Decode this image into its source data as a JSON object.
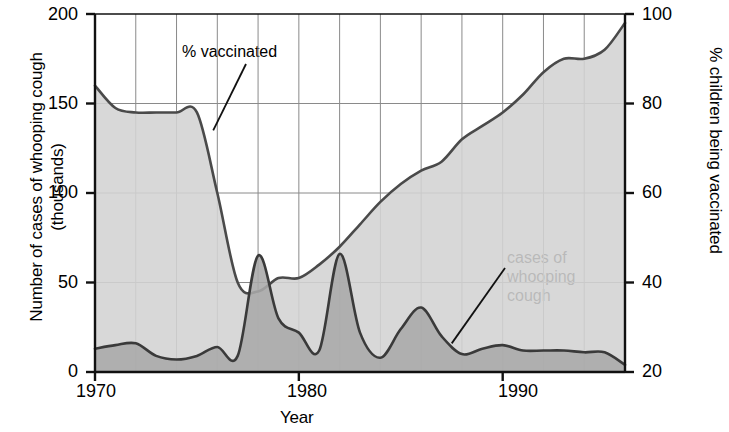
{
  "chart_data": {
    "type": "area",
    "title": "",
    "xlabel": "Year",
    "ylabel_left": "Number of cases of whooping cough (thousands)",
    "ylabel_right": "% children being vaccinated",
    "xlim": [
      1970,
      1996
    ],
    "xticks": [
      1970,
      1980,
      1990
    ],
    "xticklabels": [
      "1970",
      "1980",
      "1990"
    ],
    "xgrid_step": 2,
    "grid": true,
    "legend_position": "inline-annotations",
    "left_axis": {
      "label": "Number of cases of whooping cough (thousands)",
      "ticks": [
        0,
        50,
        100,
        150,
        200
      ],
      "ticklabels": [
        "0",
        "50",
        "100",
        "150",
        "200"
      ],
      "lim": [
        0,
        200
      ]
    },
    "right_axis": {
      "label": "% children being vaccinated",
      "ticks": [
        20,
        40,
        60,
        80,
        100
      ],
      "ticklabels": [
        "20",
        "40",
        "60",
        "80",
        "100"
      ],
      "lim": [
        20,
        100
      ]
    },
    "annotations": [
      {
        "name": "vaccinated-label",
        "text": "% vaccinated",
        "lines": [
          "% vaccinated"
        ],
        "points_to_year": 1975.8,
        "points_to_value": 74
      },
      {
        "name": "cases-label",
        "text": "cases of whooping cough",
        "lines": [
          "cases of",
          "whooping",
          "cough"
        ],
        "points_to_year": 1987.5,
        "points_to_value": 16
      }
    ],
    "series": [
      {
        "name": "% vaccinated",
        "axis": "right",
        "unit": "%",
        "fill_color": "#d3d3d3",
        "line_color": "#4a4a4a",
        "x": [
          1970,
          1971,
          1972,
          1973,
          1974,
          1975,
          1976,
          1977,
          1978,
          1979,
          1980,
          1981,
          1982,
          1983,
          1984,
          1985,
          1986,
          1987,
          1988,
          1989,
          1990,
          1991,
          1992,
          1993,
          1994,
          1995,
          1996
        ],
        "values": [
          84,
          79,
          78,
          78,
          78,
          78,
          60,
          40,
          38,
          41,
          41,
          44,
          48,
          53,
          58,
          62,
          65,
          67,
          72,
          75,
          78,
          82,
          87,
          90,
          90,
          92,
          98
        ]
      },
      {
        "name": "cases of whooping cough",
        "axis": "left",
        "unit": "thousands",
        "fill_color": "#a8a8a8",
        "line_color": "#3a3a3a",
        "x": [
          1970,
          1971,
          1972,
          1973,
          1974,
          1975,
          1976,
          1977,
          1978,
          1979,
          1980,
          1981,
          1982,
          1983,
          1984,
          1985,
          1986,
          1987,
          1988,
          1989,
          1990,
          1991,
          1992,
          1993,
          1994,
          1995,
          1996
        ],
        "values": [
          13,
          15,
          16,
          9,
          7,
          9,
          14,
          9,
          65,
          30,
          22,
          12,
          66,
          22,
          8,
          24,
          36,
          20,
          10,
          13,
          15,
          12,
          12,
          12,
          11,
          11,
          4
        ]
      }
    ]
  },
  "plot": {
    "left_px": 95,
    "right_px": 625,
    "top_px": 14,
    "bottom_px": 372
  }
}
